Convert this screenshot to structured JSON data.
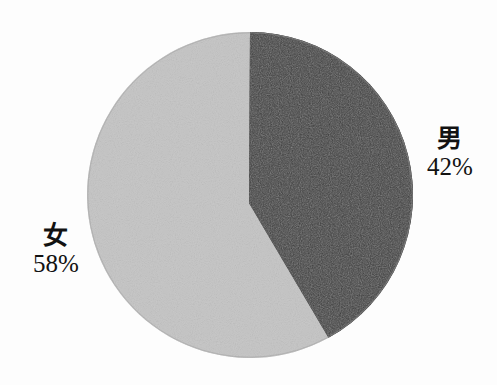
{
  "chart_data": {
    "type": "pie",
    "title": "",
    "subtitle": "",
    "xlabel": "",
    "ylabel": "",
    "legend_position": "none",
    "grid": false,
    "start_angle_deg": 0,
    "direction": "clockwise",
    "units": "percent",
    "categories": [
      "男",
      "女"
    ],
    "values": [
      42,
      58
    ],
    "slices": [
      {
        "label": "男",
        "value": 42,
        "value_text": "42%",
        "color": "#3b3b3b",
        "angle_deg": 151.2,
        "label_side": "right"
      },
      {
        "label": "女",
        "value": 58,
        "value_text": "58%",
        "color": "#c9c9c9",
        "angle_deg": 208.8,
        "label_side": "left"
      }
    ],
    "annotations": []
  },
  "figure": {
    "background_color": "#ffffff",
    "outline_color": "#8a8a8a"
  },
  "labels": {
    "male": {
      "category": "男",
      "percent": "42%"
    },
    "female": {
      "category": "女",
      "percent": "58%"
    }
  }
}
